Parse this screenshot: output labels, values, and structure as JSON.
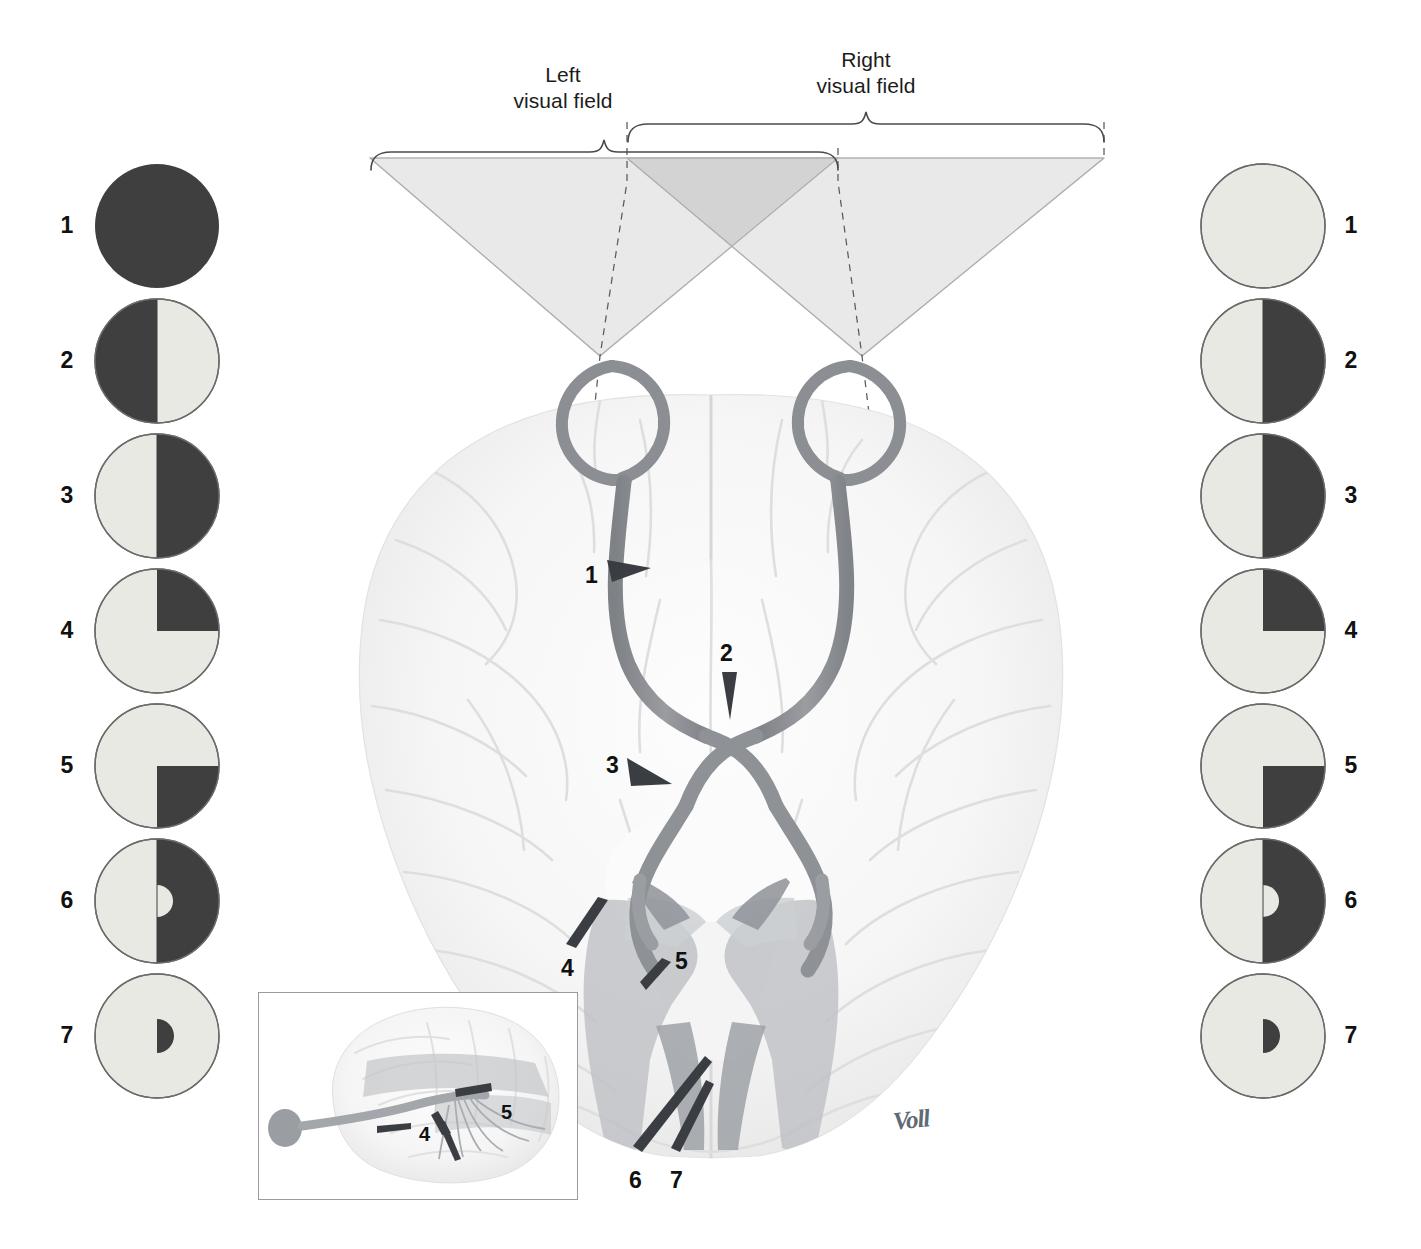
{
  "figure": {
    "type": "anatomical-diagram",
    "signature": "Voll"
  },
  "labels": {
    "left_visual_field": "Left\nvisual field",
    "left_visual_field_line1": "Left",
    "left_visual_field_line2": "visual field",
    "right_visual_field_line1": "Right",
    "right_visual_field_line2": "visual field"
  },
  "colors": {
    "deficit_dark": "#3f3f3f",
    "intact_light": "#e9e9e4",
    "circle_outline": "#6b6b6b",
    "cone_single": "#e9e9e9",
    "cone_overlap": "#d5d5d5",
    "cone_edge": "#b4b4b4",
    "nerve_gray": "#8d8f93",
    "brain_gray": "#f2f2f2",
    "radiation_gray": "#b9bbbe",
    "marker_dark": "#3a3d42",
    "brace_line": "#4a4a4a",
    "inset_border": "#9a9aa0"
  },
  "lesion_sites": [
    {
      "id": 1,
      "label": "1",
      "site": "optic-nerve"
    },
    {
      "id": 2,
      "label": "2",
      "site": "optic-chiasm"
    },
    {
      "id": 3,
      "label": "3",
      "site": "optic-tract"
    },
    {
      "id": 4,
      "label": "4",
      "site": "optic-radiation-temporal-meyer-loop"
    },
    {
      "id": 5,
      "label": "5",
      "site": "optic-radiation-parietal"
    },
    {
      "id": 6,
      "label": "6",
      "site": "visual-cortex"
    },
    {
      "id": 7,
      "label": "7",
      "site": "occipital-pole-macular"
    }
  ],
  "left_eye_fields": [
    {
      "n": "1",
      "pattern": "full",
      "note": "complete blindness left eye"
    },
    {
      "n": "2",
      "pattern": "left-half",
      "note": "nasal/temporal half dark"
    },
    {
      "n": "3",
      "pattern": "right-half",
      "note": "homonymous hemianopia"
    },
    {
      "n": "4",
      "pattern": "upper-right-quad",
      "note": "upper quadrantanopia"
    },
    {
      "n": "5",
      "pattern": "lower-right-quad",
      "note": "lower quadrantanopia"
    },
    {
      "n": "6",
      "pattern": "right-half-spared",
      "note": "hemianopia with macular sparing"
    },
    {
      "n": "7",
      "pattern": "macula-right",
      "note": "macular defect only"
    }
  ],
  "right_eye_fields": [
    {
      "n": "1",
      "pattern": "none",
      "note": "normal field"
    },
    {
      "n": "2",
      "pattern": "right-half",
      "note": "temporal half dark"
    },
    {
      "n": "3",
      "pattern": "right-half",
      "note": "homonymous hemianopia"
    },
    {
      "n": "4",
      "pattern": "upper-right-quad",
      "note": "upper quadrantanopia"
    },
    {
      "n": "5",
      "pattern": "lower-right-quad",
      "note": "lower quadrantanopia"
    },
    {
      "n": "6",
      "pattern": "right-half-spared",
      "note": "hemianopia with macular sparing"
    },
    {
      "n": "7",
      "pattern": "macula-right",
      "note": "macular defect only"
    }
  ],
  "inset": {
    "caption": "lateral view of optic radiation",
    "markers": [
      {
        "label": "4"
      },
      {
        "label": "5"
      }
    ]
  },
  "diagram_markers": [
    {
      "label": "1",
      "x": 592,
      "y": 577
    },
    {
      "label": "2",
      "x": 727,
      "y": 656
    },
    {
      "label": "3",
      "x": 613,
      "y": 769
    },
    {
      "label": "4",
      "x": 568,
      "y": 971
    },
    {
      "label": "5",
      "x": 681,
      "y": 964
    },
    {
      "label": "6",
      "x": 635,
      "y": 1183
    },
    {
      "label": "7",
      "x": 676,
      "y": 1183
    }
  ]
}
